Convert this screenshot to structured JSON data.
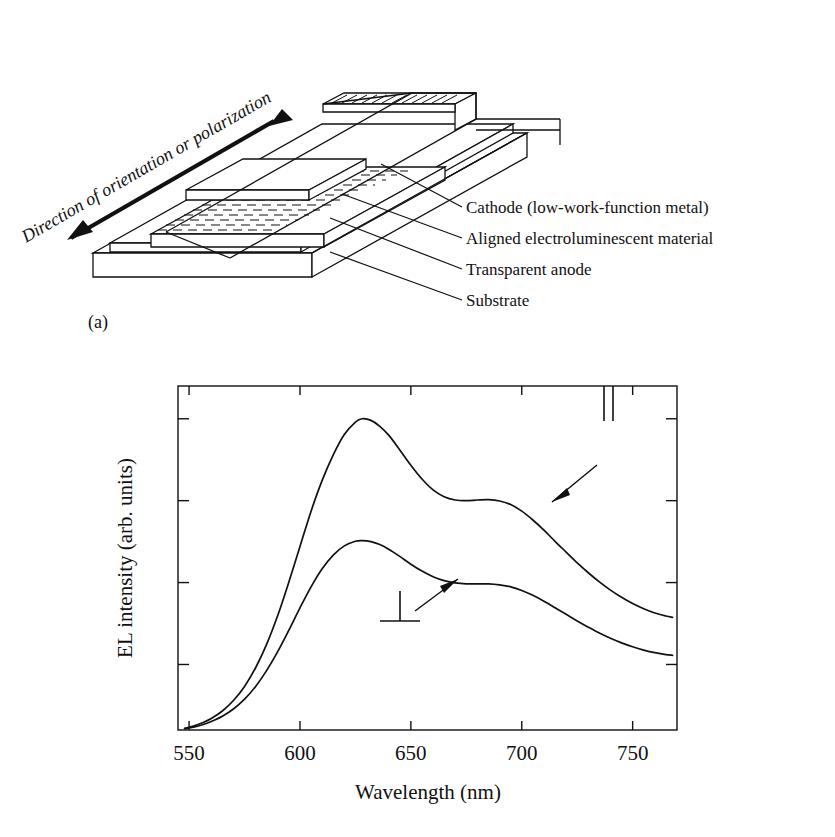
{
  "figure": {
    "panel_a_tag": "(a)",
    "panel_b_tag": "(b)"
  },
  "diagram": {
    "arrow_label": "Direction of orientation or polarization",
    "callouts": [
      {
        "key": "cathode",
        "label": "Cathode (low-work-function metal)"
      },
      {
        "key": "aligned",
        "label": "Aligned electroluminescent material"
      },
      {
        "key": "anode",
        "label": "Transparent anode"
      },
      {
        "key": "substrate",
        "label": "Substrate"
      }
    ],
    "stroke_color": "#111111",
    "fill_color": "#ffffff"
  },
  "chart_data": {
    "type": "line",
    "title": "",
    "xlabel": "Wavelength (nm)",
    "ylabel": "EL intensity (arb. units)",
    "xlim": [
      545,
      770
    ],
    "ylim": [
      0,
      1.05
    ],
    "xticks": [
      550,
      600,
      650,
      700,
      750
    ],
    "xtick_labels": [
      "550",
      "600",
      "650",
      "700",
      "750"
    ],
    "yticks": [
      0.2,
      0.45,
      0.7,
      0.95
    ],
    "ytick_labels": [
      "",
      "",
      "",
      ""
    ],
    "grid": false,
    "legend_position": "inline-annotations",
    "annotations": [
      {
        "key": "parallel",
        "symbol": "‖",
        "label": "parallel polarization",
        "points_to": "upper-curve"
      },
      {
        "key": "perpendicular",
        "symbol": "⊥",
        "label": "perpendicular polarization",
        "points_to": "lower-curve"
      }
    ],
    "series": [
      {
        "name": "‖",
        "annotation_key": "parallel",
        "x": [
          548,
          552,
          556,
          560,
          565,
          570,
          575,
          580,
          585,
          590,
          595,
          600,
          605,
          610,
          615,
          620,
          625,
          628,
          632,
          636,
          640,
          645,
          650,
          655,
          660,
          665,
          670,
          675,
          680,
          685,
          690,
          695,
          700,
          705,
          710,
          715,
          720,
          725,
          730,
          735,
          740,
          745,
          750,
          755,
          760,
          765,
          768
        ],
        "y": [
          0.005,
          0.012,
          0.022,
          0.035,
          0.058,
          0.09,
          0.133,
          0.19,
          0.262,
          0.35,
          0.452,
          0.56,
          0.668,
          0.762,
          0.84,
          0.902,
          0.94,
          0.95,
          0.945,
          0.927,
          0.9,
          0.855,
          0.808,
          0.766,
          0.733,
          0.712,
          0.702,
          0.7,
          0.702,
          0.703,
          0.699,
          0.688,
          0.668,
          0.641,
          0.61,
          0.576,
          0.543,
          0.51,
          0.48,
          0.452,
          0.427,
          0.405,
          0.386,
          0.37,
          0.357,
          0.348,
          0.344
        ]
      },
      {
        "name": "⊥",
        "annotation_key": "perpendicular",
        "x": [
          548,
          552,
          556,
          560,
          565,
          570,
          575,
          580,
          585,
          590,
          595,
          600,
          605,
          610,
          615,
          620,
          625,
          628,
          632,
          636,
          640,
          645,
          650,
          655,
          660,
          665,
          670,
          675,
          680,
          685,
          690,
          695,
          700,
          705,
          710,
          715,
          720,
          725,
          730,
          735,
          740,
          745,
          750,
          755,
          760,
          765,
          768
        ],
        "y": [
          0.004,
          0.009,
          0.016,
          0.026,
          0.042,
          0.064,
          0.094,
          0.133,
          0.182,
          0.24,
          0.305,
          0.373,
          0.437,
          0.492,
          0.534,
          0.562,
          0.576,
          0.578,
          0.575,
          0.566,
          0.552,
          0.53,
          0.506,
          0.485,
          0.468,
          0.456,
          0.449,
          0.446,
          0.446,
          0.446,
          0.443,
          0.437,
          0.426,
          0.411,
          0.393,
          0.373,
          0.353,
          0.333,
          0.314,
          0.296,
          0.28,
          0.266,
          0.254,
          0.244,
          0.236,
          0.23,
          0.228
        ]
      }
    ]
  }
}
